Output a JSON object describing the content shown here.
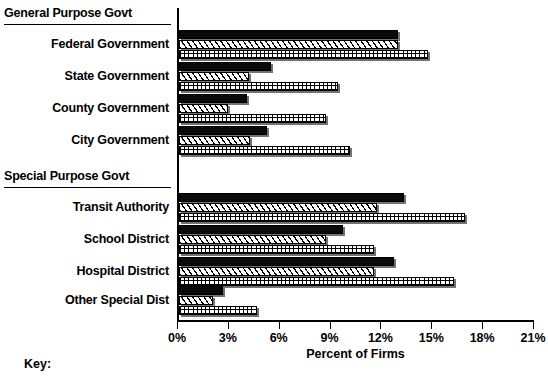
{
  "chart_data": {
    "type": "bar",
    "orientation": "horizontal",
    "title": "",
    "xlabel": "Percent of Firms",
    "ylabel": "",
    "xlim": [
      0,
      21
    ],
    "xticks": [
      0,
      3,
      6,
      9,
      12,
      15,
      18,
      21
    ],
    "xtick_labels": [
      "0%",
      "3%",
      "6%",
      "9%",
      "12%",
      "15%",
      "18%",
      "21%"
    ],
    "grid": false,
    "legend_position": "below-key",
    "group_headers": [
      "General Purpose Govt",
      "Special Purpose Govt"
    ],
    "categories": [
      "Federal Government",
      "State Government",
      "County Government",
      "City Government",
      "Transit Authority",
      "School District",
      "Hospital District",
      "Other Special Dist"
    ],
    "series": [
      {
        "name": "series-1-solid",
        "pattern": "solid-black",
        "values": [
          12.9,
          5.4,
          4.0,
          5.2,
          13.3,
          9.7,
          12.7,
          2.6
        ]
      },
      {
        "name": "series-2-diagonal",
        "pattern": "diagonal-hatch",
        "values": [
          12.9,
          4.1,
          2.9,
          4.2,
          11.7,
          8.7,
          11.5,
          2.0
        ]
      },
      {
        "name": "series-3-grid",
        "pattern": "grid-hatch",
        "values": [
          14.7,
          9.4,
          8.7,
          10.1,
          16.9,
          11.5,
          16.2,
          4.6
        ]
      }
    ]
  },
  "key": {
    "label": "Key:"
  },
  "colors": {
    "ink": "#000000",
    "paper": "#ffffff"
  }
}
